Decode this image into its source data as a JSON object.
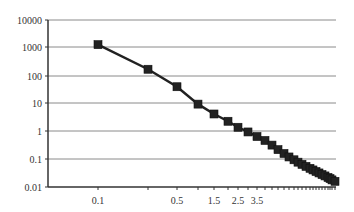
{
  "chart_data": {
    "type": "line",
    "title": "",
    "xlabel": "",
    "ylabel": "",
    "y_scale": "log",
    "ylim": [
      0.01,
      10000
    ],
    "y_ticks": [
      "10000",
      "1000",
      "100",
      "10",
      "1",
      "0.1",
      "0.01"
    ],
    "x_tick_labels": [
      {
        "label": "0.1",
        "index": 0
      },
      {
        "label": "0.5",
        "index": 2
      },
      {
        "label": "1.5",
        "index": 4
      },
      {
        "label": "2.5",
        "index": 6
      },
      {
        "label": "3.5",
        "index": 8
      }
    ],
    "grid": {
      "horizontal": true,
      "vertical": false
    },
    "legend": null,
    "series": [
      {
        "name": "series1",
        "marker": "square",
        "color": "#222222",
        "x": [
          0.1,
          0.3,
          0.5,
          1.0,
          1.5,
          2.0,
          2.5,
          3.0,
          3.5,
          4.0,
          4.5,
          5.0,
          5.5,
          6.0,
          6.5,
          7.0,
          7.5,
          8.0,
          8.5,
          9.0,
          9.5,
          10.0,
          10.5,
          11.0,
          11.5,
          12.0,
          12.5,
          13.0
        ],
        "values": [
          1300,
          170,
          40,
          9.5,
          4.2,
          2.3,
          1.4,
          0.95,
          0.65,
          0.47,
          0.32,
          0.22,
          0.16,
          0.12,
          0.095,
          0.078,
          0.065,
          0.055,
          0.047,
          0.041,
          0.036,
          0.032,
          0.028,
          0.025,
          0.022,
          0.02,
          0.018,
          0.016
        ],
        "px": [
          98,
          148,
          177,
          198,
          214,
          228,
          238,
          248,
          257,
          265,
          272,
          278,
          284,
          289,
          294,
          298,
          302,
          306,
          310,
          313,
          316,
          319,
          322,
          325,
          328,
          330,
          332,
          335
        ]
      }
    ]
  },
  "axis": {
    "y_labels": [
      {
        "text": "10000",
        "y": 20
      },
      {
        "text": "1000",
        "y": 47
      },
      {
        "text": "100",
        "y": 76
      },
      {
        "text": "10",
        "y": 103
      },
      {
        "text": "1",
        "y": 131
      },
      {
        "text": "0.1",
        "y": 159
      },
      {
        "text": "0.01",
        "y": 187
      }
    ],
    "x_labels": [
      {
        "text": "0.1",
        "x": 98
      },
      {
        "text": "0.5",
        "x": 177
      },
      {
        "text": "1.5",
        "x": 214
      },
      {
        "text": "2.5",
        "x": 238
      },
      {
        "text": "3.5",
        "x": 257
      }
    ]
  }
}
